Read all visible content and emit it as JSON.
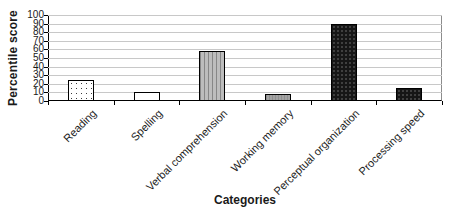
{
  "chart_data": {
    "type": "bar",
    "title": "",
    "categories": [
      "Reading",
      "Spelling",
      "Verbal comprehension",
      "Working memory",
      "Perceptual organization",
      "Processing speed"
    ],
    "values": [
      25,
      11,
      58,
      8,
      89,
      15
    ],
    "xlabel": "Categories",
    "ylabel": "Percentile score",
    "ylim": [
      0,
      100
    ],
    "yticks": [
      0,
      10,
      20,
      30,
      40,
      50,
      60,
      70,
      80,
      90,
      100
    ],
    "grid": true,
    "legend": false,
    "bar_patterns": [
      "dotted-white",
      "plain-white",
      "striped-gray",
      "solid-gray",
      "speckled-black",
      "speckled-black"
    ],
    "bar_border_color": "#000000",
    "gridline_color": "#c8c8c8",
    "axis_color": "#000000",
    "text_color": "#1a1a1a"
  }
}
